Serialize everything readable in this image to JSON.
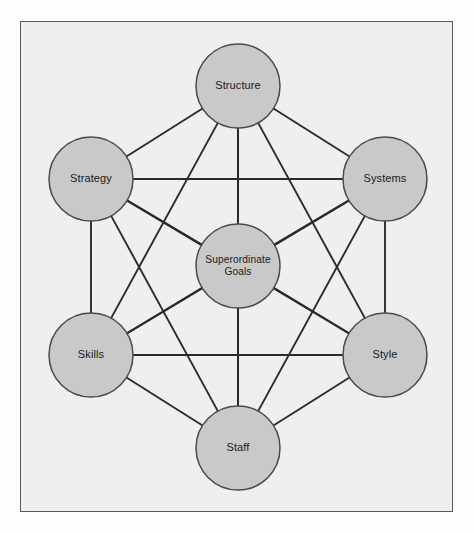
{
  "diagram": {
    "type": "network-diagram",
    "frame": {
      "border_color": "#5a5a5e",
      "background_color": "#efefef",
      "outer_background_color": "#fdfdfd"
    },
    "style": {
      "node_fill": "#c9c9c9",
      "node_stroke": "#4a4a4e",
      "edge_color": "#2b2b2e",
      "label_color": "#1a1a1a",
      "node_radius": 42
    },
    "nodes": [
      {
        "id": "structure",
        "label": "Structure",
        "label_lines": [
          "Structure"
        ],
        "cx": 238,
        "cy": 86,
        "r": 42,
        "position": "top"
      },
      {
        "id": "strategy",
        "label": "Strategy",
        "label_lines": [
          "Strategy"
        ],
        "cx": 91,
        "cy": 179,
        "r": 42,
        "position": "upper-left"
      },
      {
        "id": "systems",
        "label": "Systems",
        "label_lines": [
          "Systems"
        ],
        "cx": 385,
        "cy": 179,
        "r": 42,
        "position": "upper-right"
      },
      {
        "id": "goals",
        "label": "Superordinate Goals",
        "label_lines": [
          "Superordinate",
          "Goals"
        ],
        "cx": 238,
        "cy": 266,
        "r": 42,
        "position": "center"
      },
      {
        "id": "skills",
        "label": "Skills",
        "label_lines": [
          "Skills"
        ],
        "cx": 91,
        "cy": 355,
        "r": 42,
        "position": "lower-left"
      },
      {
        "id": "style",
        "label": "Style",
        "label_lines": [
          "Style"
        ],
        "cx": 385,
        "cy": 355,
        "r": 42,
        "position": "lower-right"
      },
      {
        "id": "staff",
        "label": "Staff",
        "label_lines": [
          "Staff"
        ],
        "cx": 238,
        "cy": 448,
        "r": 42,
        "position": "bottom"
      }
    ],
    "edges": [
      {
        "from": "structure",
        "to": "strategy"
      },
      {
        "from": "structure",
        "to": "systems"
      },
      {
        "from": "structure",
        "to": "goals"
      },
      {
        "from": "structure",
        "to": "skills"
      },
      {
        "from": "structure",
        "to": "style"
      },
      {
        "from": "structure",
        "to": "staff"
      },
      {
        "from": "strategy",
        "to": "systems"
      },
      {
        "from": "strategy",
        "to": "goals"
      },
      {
        "from": "strategy",
        "to": "skills"
      },
      {
        "from": "strategy",
        "to": "style"
      },
      {
        "from": "strategy",
        "to": "staff"
      },
      {
        "from": "systems",
        "to": "goals"
      },
      {
        "from": "systems",
        "to": "skills"
      },
      {
        "from": "systems",
        "to": "style"
      },
      {
        "from": "systems",
        "to": "staff"
      },
      {
        "from": "goals",
        "to": "skills"
      },
      {
        "from": "goals",
        "to": "style"
      },
      {
        "from": "goals",
        "to": "staff"
      },
      {
        "from": "skills",
        "to": "style"
      },
      {
        "from": "skills",
        "to": "staff"
      },
      {
        "from": "style",
        "to": "staff"
      }
    ]
  }
}
